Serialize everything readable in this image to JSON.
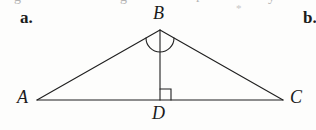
{
  "page": {
    "background_color": "#fdfdfc",
    "ink_color": "#1b1b1b",
    "width": 316,
    "height": 130
  },
  "item": {
    "label": "a.",
    "next_item_label": "b."
  },
  "artifacts": {
    "asterisk": "*",
    "clipped_line_above": [
      "g",
      "g",
      "r",
      "y"
    ]
  },
  "figure": {
    "type": "geometry-diagram",
    "stroke_color": "#1f1f1f",
    "stroke_width": 1.1,
    "vertices": [
      {
        "name": "A",
        "x": 37,
        "y": 100
      },
      {
        "name": "B",
        "x": 160,
        "y": 30
      },
      {
        "name": "C",
        "x": 283,
        "y": 100
      },
      {
        "name": "D",
        "x": 160,
        "y": 100
      }
    ],
    "segments": [
      {
        "name": "AB",
        "from": "A",
        "to": "B"
      },
      {
        "name": "BC",
        "from": "B",
        "to": "C"
      },
      {
        "name": "AC",
        "from": "A",
        "to": "C"
      },
      {
        "name": "BD",
        "from": "B",
        "to": "D"
      }
    ],
    "marks": [
      {
        "name": "angle-arc-B",
        "at": "B",
        "kind": "arc",
        "radius": 14
      },
      {
        "name": "right-angle-D",
        "at": "D",
        "kind": "square",
        "size": 11
      }
    ],
    "labels": {
      "A": "A",
      "B": "B",
      "C": "C",
      "D": "D"
    }
  }
}
